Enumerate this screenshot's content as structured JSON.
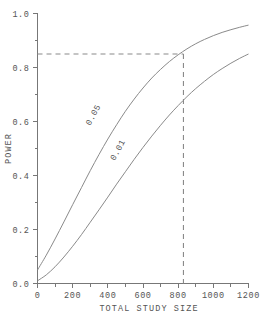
{
  "chart_data": {
    "type": "line",
    "title": "",
    "xlabel": "TOTAL STUDY SIZE",
    "ylabel": "POWER",
    "xlim": [
      0,
      1200
    ],
    "ylim": [
      0.0,
      1.0
    ],
    "grid": false,
    "legend_position": "inline-curve-labels",
    "x_ticks_major": [
      0,
      200,
      400,
      600,
      800,
      1000,
      1200
    ],
    "x_tick_labels": [
      "0",
      "200",
      "400",
      "600",
      "800",
      "1000",
      "1200"
    ],
    "x_ticks_minor": [
      100,
      300,
      500,
      700,
      900,
      1100
    ],
    "y_ticks_major": [
      0.0,
      0.2,
      0.4,
      0.6,
      0.8,
      1.0
    ],
    "y_tick_labels": [
      "0.0",
      "0.2",
      "0.4",
      "0.6",
      "0.8",
      "1.0"
    ],
    "y_ticks_minor": [
      0.1,
      0.3,
      0.5,
      0.7,
      0.9
    ],
    "x": [
      0,
      50,
      100,
      150,
      200,
      250,
      300,
      350,
      400,
      450,
      500,
      550,
      600,
      650,
      700,
      750,
      800,
      850,
      900,
      950,
      1000,
      1050,
      1100,
      1150,
      1200
    ],
    "series": [
      {
        "name": "0.05",
        "label": "0.05",
        "label_x": 330,
        "label_y": 0.62,
        "values": [
          0.05,
          0.105,
          0.165,
          0.228,
          0.292,
          0.355,
          0.418,
          0.478,
          0.535,
          0.588,
          0.638,
          0.683,
          0.724,
          0.761,
          0.793,
          0.822,
          0.847,
          0.869,
          0.888,
          0.904,
          0.918,
          0.93,
          0.94,
          0.949,
          0.957
        ]
      },
      {
        "name": "0.01",
        "label": "0.01",
        "label_x": 470,
        "label_y": 0.49,
        "values": [
          0.01,
          0.032,
          0.062,
          0.098,
          0.138,
          0.181,
          0.227,
          0.273,
          0.32,
          0.368,
          0.414,
          0.46,
          0.504,
          0.546,
          0.586,
          0.624,
          0.659,
          0.692,
          0.722,
          0.749,
          0.774,
          0.796,
          0.816,
          0.834,
          0.85
        ]
      }
    ],
    "annotations": [
      {
        "type": "reference-lines",
        "power": 0.85,
        "study_size": 830,
        "description": "dashed lines marking power 0.85 intersecting the 0.01 curve near total study size 830"
      }
    ]
  }
}
